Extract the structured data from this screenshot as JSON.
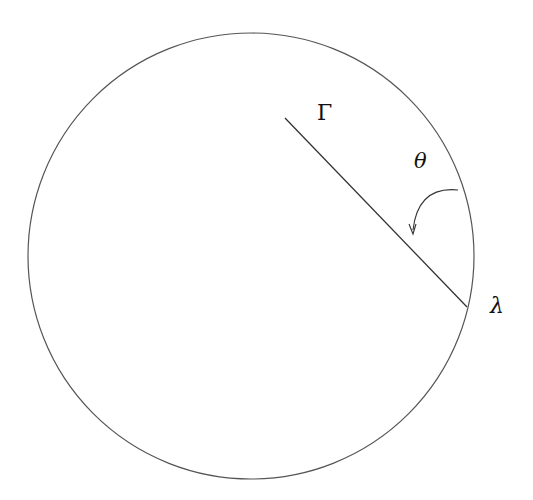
{
  "diagram": {
    "labels": {
      "gamma": "Γ",
      "theta": "θ",
      "lambda": "λ"
    },
    "circle": {
      "cx": 251,
      "cy": 256,
      "r": 223,
      "stroke": "#555555"
    },
    "radius_line": {
      "x1": 285,
      "y1": 118,
      "x2": 467,
      "y2": 307,
      "stroke": "#333333"
    },
    "arrow_arc": {
      "from": [
        458,
        190
      ],
      "to": [
        413,
        232
      ],
      "stroke": "#333333"
    }
  }
}
